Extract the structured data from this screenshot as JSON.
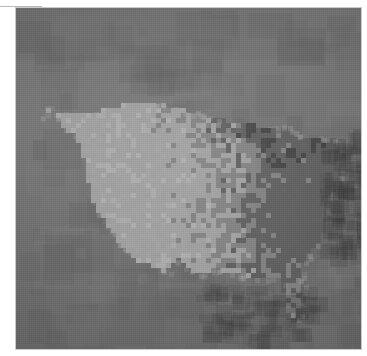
{
  "figure": {
    "kind": "raster-choropleth-map",
    "projection": "albers-like",
    "has_title": false,
    "has_legend": false,
    "has_axis_labels": false,
    "has_caption": false,
    "rendering": "pixelated grid of county-scale cells, grayscale"
  },
  "canvas": {
    "width": 367,
    "height": 356,
    "page_background": "#ffffff",
    "plate": {
      "x": 16,
      "y": 8,
      "width": 345,
      "height": 341,
      "border_color": "#c9c9c9"
    }
  },
  "artifacts": {
    "top_rule": {
      "x": 0,
      "y": 6,
      "width": 42,
      "height": 1,
      "color": "#b9b9b9"
    },
    "corner_mark": {
      "x": 342,
      "y": 7,
      "size": 9,
      "color": "#9f9f9f"
    }
  },
  "palette": {
    "ocean_background": "#6e6e6e",
    "background_light": "#767676",
    "background_dark": "#5e5e5e",
    "land_light": "#9e9e9e",
    "land_lighter": "#ababab",
    "land_mid": "#7d7d7d",
    "land_dark": "#585858",
    "water_body_dark": "#3c3c3c",
    "water_body_darkest": "#2f2f2f"
  },
  "chart_data": {
    "type": "heatmap",
    "title": "",
    "xlabel": "",
    "ylabel": "",
    "grid": false,
    "legend_position": "none",
    "colorscale": [
      "#585858",
      "#6e6e6e",
      "#7d7d7d",
      "#9e9e9e",
      "#ababab"
    ],
    "cell_size_px": 5,
    "grid_width": 69,
    "grid_height": 68,
    "regions": [
      {
        "name": "Pacific Northwest",
        "tone": "light"
      },
      {
        "name": "Great Plains",
        "tone": "light"
      },
      {
        "name": "Upper Midwest",
        "tone": "mixed"
      },
      {
        "name": "Northeast",
        "tone": "mixed"
      },
      {
        "name": "Southeast",
        "tone": "mixed"
      },
      {
        "name": "Florida peninsula",
        "tone": "light"
      },
      {
        "name": "Great Lakes",
        "tone": "dark-water"
      },
      {
        "name": "Atlantic Ocean",
        "tone": "dark"
      },
      {
        "name": "Gulf of Mexico",
        "tone": "dark"
      },
      {
        "name": "Pacific Ocean",
        "tone": "dark"
      }
    ]
  }
}
